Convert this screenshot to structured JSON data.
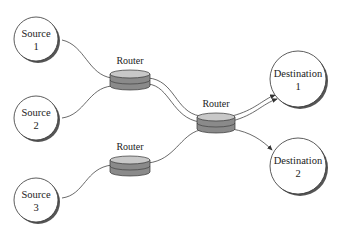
{
  "diagram": {
    "sources": [
      {
        "name": "Source",
        "number": "1"
      },
      {
        "name": "Source",
        "number": "2"
      },
      {
        "name": "Source",
        "number": "3"
      }
    ],
    "routers": [
      {
        "label": "Router"
      },
      {
        "label": "Router"
      },
      {
        "label": "Router"
      }
    ],
    "destinations": [
      {
        "name": "Destination",
        "number": "1"
      },
      {
        "name": "Destination",
        "number": "2"
      }
    ],
    "colors": {
      "router_fill": "#8a8a8a",
      "router_top": "#c8c8c8",
      "node_fill": "#ffffff",
      "stroke": "#333333"
    }
  }
}
